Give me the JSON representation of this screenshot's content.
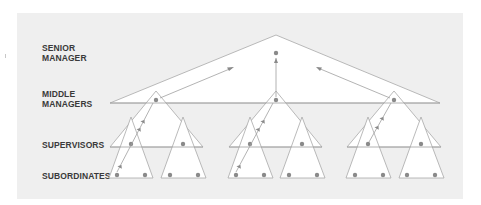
{
  "diagram": {
    "levels": [
      {
        "label_line1": "SENIOR",
        "label_line2": "MANAGER"
      },
      {
        "label_line1": "MIDDLE",
        "label_line2": "MANAGERS"
      },
      {
        "label_line1": "SUPERVISORS",
        "label_line2": ""
      },
      {
        "label_line1": "SUBORDINATES",
        "label_line2": ""
      }
    ],
    "structure": {
      "senior_manager": 1,
      "middle_managers": 3,
      "supervisors_per_middle": 2,
      "subordinates_per_supervisor": 2
    },
    "colors": {
      "panel_background": "#efefef",
      "triangle_fill": "#ffffff",
      "line": "#a8a8a8",
      "node": "#8a8a8a",
      "label_text": "#3a3a3a"
    }
  }
}
